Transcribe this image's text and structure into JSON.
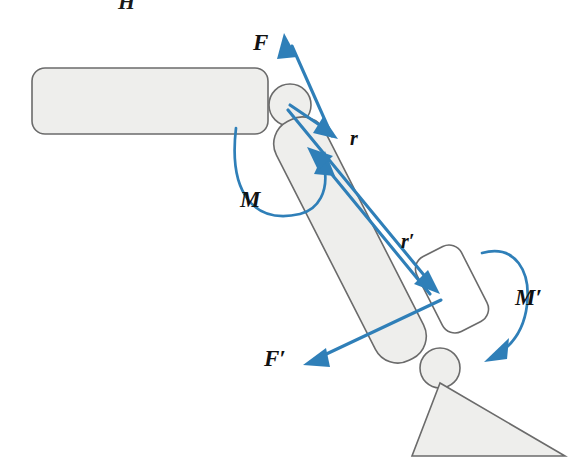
{
  "figure": {
    "kind": "mechanics-diagram",
    "background_color": "#ffffff",
    "vector_color": "#2f7fb8",
    "body_fill_color": "#eeeeec",
    "body_stroke_color": "#6b6b6b",
    "white_body_fill_color": "#ffffff"
  },
  "labels": {
    "force_upper": "F",
    "force_lower": "F′",
    "moment_upper": "M",
    "moment_lower": "M′",
    "radius_upper": "r",
    "radius_lower": "r′",
    "cropped_top": "H"
  },
  "bodies": [
    {
      "name": "horizontal-link",
      "shape": "rounded-rectangle",
      "fill": "#eeeeec",
      "x": 32,
      "y": 68,
      "width": 236,
      "height": 66,
      "radius": 13
    },
    {
      "name": "inclined-link",
      "shape": "rounded-rectangle-rotated",
      "fill": "#eeeeec",
      "cx": 350,
      "cy": 240,
      "width": 54,
      "height": 268,
      "radius": 24,
      "rotation_deg": 27
    },
    {
      "name": "end-effector-block",
      "shape": "rounded-rectangle-rotated",
      "fill": "#ffffff",
      "cx": 452,
      "cy": 289,
      "width": 50,
      "height": 84,
      "radius": 14,
      "rotation_deg": 27
    },
    {
      "name": "ground-support-triangle",
      "shape": "triangle",
      "fill": "#eeeeec",
      "points": "440,383 412,456 565,456"
    }
  ],
  "joints": [
    {
      "name": "upper-pivot-joint",
      "cx": 290,
      "cy": 105,
      "r": 21
    },
    {
      "name": "lower-pivot-joint",
      "cx": 440,
      "cy": 368,
      "r": 20
    }
  ],
  "vectors": [
    {
      "name": "force-F",
      "label": "F",
      "type": "single-headed-arrow",
      "from": {
        "x": 330,
        "y": 140
      },
      "to": {
        "x": 285,
        "y": 38
      },
      "label_pos": {
        "x": 258,
        "y": 45
      }
    },
    {
      "name": "radius-r",
      "label": "r",
      "type": "single-headed-arrow",
      "from": {
        "x": 290,
        "y": 105
      },
      "to": {
        "x": 334,
        "y": 137
      },
      "label_pos": {
        "x": 352,
        "y": 138
      }
    },
    {
      "name": "radius-r-prime",
      "label": "r′",
      "type": "single-headed-arrow",
      "from": {
        "x": 288,
        "y": 112
      },
      "to": {
        "x": 437,
        "y": 292
      },
      "label_pos": {
        "x": 403,
        "y": 243
      }
    },
    {
      "name": "link-axis-arrow",
      "type": "single-headed-arrow",
      "from": {
        "x": 432,
        "y": 296
      },
      "to": {
        "x": 310,
        "y": 148
      }
    },
    {
      "name": "force-F-prime",
      "label": "F′",
      "type": "single-headed-arrow",
      "from": {
        "x": 440,
        "y": 300
      },
      "to": {
        "x": 305,
        "y": 364
      },
      "label_pos": {
        "x": 270,
        "y": 360
      }
    }
  ],
  "moments": [
    {
      "name": "moment-M",
      "label": "M",
      "direction": "counterclockwise-sweep",
      "label_pos": {
        "x": 243,
        "y": 203
      }
    },
    {
      "name": "moment-M-prime",
      "label": "M′",
      "direction": "clockwise-sweep",
      "label_pos": {
        "x": 519,
        "y": 300
      }
    }
  ]
}
